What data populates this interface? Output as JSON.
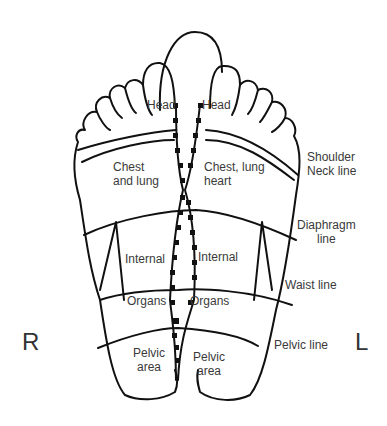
{
  "diagram": {
    "side_labels": {
      "right": "R",
      "left": "L"
    },
    "right_foot_zones": {
      "head": "Head",
      "chest": [
        "Chest",
        "and lung"
      ],
      "internal": "Internal",
      "organs": "Organs",
      "pelvic": [
        "Pelvic",
        "area"
      ]
    },
    "left_foot_zones": {
      "head": "Head",
      "chest": [
        "Chest, lung",
        "heart"
      ],
      "internal": "Internal",
      "organs": "Organs",
      "pelvic": [
        "Pelvic",
        "area"
      ]
    },
    "lines": {
      "shoulder_neck": [
        "Shoulder",
        "Neck line"
      ],
      "diaphragm": [
        "Diaphragm",
        "line"
      ],
      "waist": "Waist line",
      "pelvic": "Pelvic line"
    },
    "colors": {
      "stroke": "#111111",
      "text": "#3a3a3a",
      "background": "#ffffff"
    }
  }
}
